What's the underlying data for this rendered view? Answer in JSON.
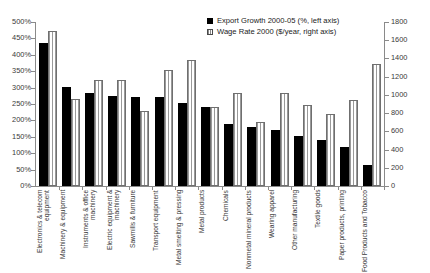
{
  "chart_data": {
    "type": "bar",
    "title": "",
    "xlabel": "",
    "grid": false,
    "legend_position": "top-right",
    "categories": [
      "Electronics & telecom equipment",
      "Machinery & equipment",
      "Instruments & office machinery",
      "Electric equipment & machinery",
      "Sawmills & furniture",
      "Transport equipment",
      "Metal smelting & pressing",
      "Metal products",
      "Chemicals",
      "Nonmetal mineral products",
      "Wearing apparel",
      "Other manufacturing",
      "Textile goods",
      "Paper products, printing",
      "Food Products and Tobacco"
    ],
    "series": [
      {
        "name": "Export Growth 2000-05 (%, left axis)",
        "axis": "left",
        "marker": "black-square",
        "color": "#000000",
        "values": [
          437,
          301,
          283,
          275,
          272,
          271,
          252,
          240,
          189,
          181,
          170,
          152,
          139,
          118,
          63
        ]
      },
      {
        "name": "Wage Rate 2000 ($/year, right axis)",
        "axis": "right",
        "marker": "hatched-square",
        "color": "#ffffff",
        "values": [
          1700,
          960,
          1160,
          1160,
          820,
          1275,
          1385,
          870,
          1025,
          700,
          1025,
          890,
          790,
          945,
          1340
        ]
      }
    ],
    "left_axis": {
      "label": "",
      "min": 0,
      "max": 500,
      "step": 50,
      "suffix": "%",
      "ticks": [
        "0%",
        "50%",
        "100%",
        "150%",
        "200%",
        "250%",
        "300%",
        "350%",
        "400%",
        "450%",
        "500%"
      ]
    },
    "right_axis": {
      "label": "",
      "min": 0,
      "max": 1800,
      "step": 200,
      "ticks": [
        "0",
        "200",
        "400",
        "600",
        "800",
        "1000",
        "1200",
        "1400",
        "1600",
        "1800"
      ]
    }
  }
}
